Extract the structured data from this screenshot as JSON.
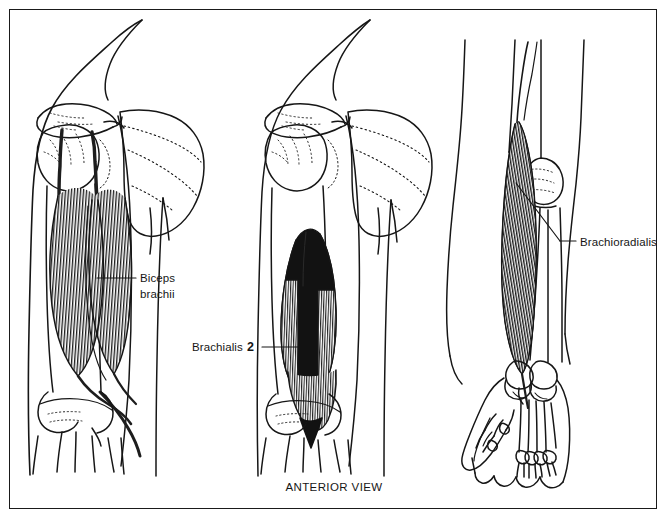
{
  "figure": {
    "caption": "ANTERIOR VIEW",
    "view": "anterior",
    "background_color": "#ffffff",
    "ink_color": "#161616",
    "border": {
      "present": true,
      "color": "#1a1a1a"
    },
    "labels": [
      {
        "id": "biceps-brachii",
        "line1": "Biceps",
        "line2": "brachii",
        "number": "",
        "panel": 1
      },
      {
        "id": "brachialis",
        "line1": "Brachialis",
        "line2": "",
        "number": "2",
        "panel": 2
      },
      {
        "id": "brachioradialis",
        "line1": "Brachioradialis",
        "line2": "",
        "number": "",
        "panel": 3
      }
    ],
    "panels": [
      {
        "index": 1,
        "subject": "Biceps brachii",
        "region": "shoulder, upper arm and elbow",
        "shows_scapula": true,
        "shows_clavicle": true,
        "shows_hand": false,
        "muscle_shading": "striated dark fibers, two heads"
      },
      {
        "index": 2,
        "subject": "Brachialis",
        "region": "shoulder, upper arm and elbow",
        "shows_scapula": true,
        "shows_clavicle": true,
        "shows_hand": false,
        "muscle_shading": "solid black spindle with striated margins"
      },
      {
        "index": 3,
        "subject": "Brachioradialis",
        "region": "elbow, forearm and hand",
        "shows_scapula": false,
        "shows_clavicle": false,
        "shows_hand": true,
        "muscle_shading": "long narrow dark striated strip"
      }
    ]
  }
}
